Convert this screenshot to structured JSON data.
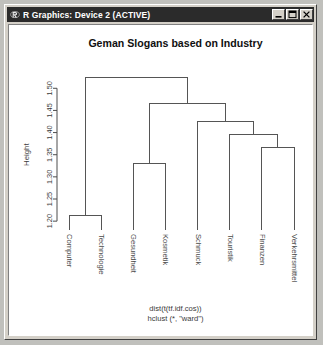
{
  "window": {
    "title": "R Graphics: Device 2 (ACTIVE)",
    "icon": "r-logo-icon",
    "controls": [
      {
        "name": "minimize-button",
        "glyph": "minimize-icon"
      },
      {
        "name": "maximize-button",
        "glyph": "maximize-icon"
      },
      {
        "name": "close-button",
        "glyph": "close-icon"
      }
    ]
  },
  "chart_data": {
    "type": "dendrogram",
    "title": "Geman Slogans based on Industry",
    "xlabel": "",
    "ylabel": "Height",
    "sub": [
      "dist(t(tf.idf.cos))",
      "hclust (*, \"ward\")"
    ],
    "grid": false,
    "legend": null,
    "ylim": [
      1.18,
      1.53
    ],
    "yticks": [
      "1.20",
      "1.25",
      "1.30",
      "1.35",
      "1.40",
      "1.45",
      "1.50"
    ],
    "ytick_values": [
      1.2,
      1.25,
      1.3,
      1.35,
      1.4,
      1.45,
      1.5
    ],
    "leaves": [
      "Computer",
      "Technologie",
      "Gesundheit",
      "Kosmetik",
      "Schmuck",
      "Touristik",
      "Finanzen",
      "Verkehrsmittel"
    ],
    "merges": [
      {
        "id": "m1",
        "left": "Computer",
        "right": "Technologie",
        "height": 1.212
      },
      {
        "id": "m2",
        "left": "Gesundheit",
        "right": "Kosmetik",
        "height": 1.33
      },
      {
        "id": "m3",
        "left": "Finanzen",
        "right": "Verkehrsmittel",
        "height": 1.367
      },
      {
        "id": "m4",
        "left": "Touristik",
        "right": "m3",
        "height": 1.396
      },
      {
        "id": "m5",
        "left": "Schmuck",
        "right": "m4",
        "height": 1.424
      },
      {
        "id": "m6",
        "left": "m2",
        "right": "m5",
        "height": 1.466
      },
      {
        "id": "m7",
        "left": "m1",
        "right": "m6",
        "height": 1.524
      }
    ],
    "line_color": "#555555",
    "axis_color": "#4d4d4d",
    "background": "#ffffff"
  }
}
